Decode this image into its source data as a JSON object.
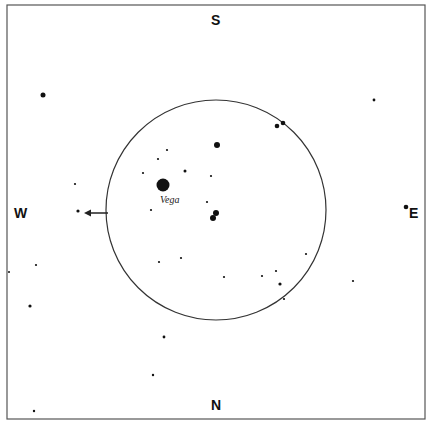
{
  "chart_data": {
    "type": "scatter",
    "directions": {
      "top": "S",
      "bottom": "N",
      "left": "W",
      "right": "E"
    },
    "circle": {
      "cx": 216,
      "cy": 210,
      "r": 110
    },
    "arrow": {
      "from": [
        108,
        213
      ],
      "to": [
        84,
        213
      ],
      "direction": "W"
    },
    "labels": [
      {
        "text": "Vega",
        "x": 172,
        "y": 203
      }
    ],
    "stars": [
      {
        "x": 43,
        "y": 95,
        "r": 2.5
      },
      {
        "x": 374,
        "y": 100,
        "r": 1.4
      },
      {
        "x": 277,
        "y": 126,
        "r": 2.3
      },
      {
        "x": 283,
        "y": 123,
        "r": 2.3
      },
      {
        "x": 217,
        "y": 145,
        "r": 3
      },
      {
        "x": 167,
        "y": 150,
        "r": 1.1
      },
      {
        "x": 158,
        "y": 159,
        "r": 1.1
      },
      {
        "x": 185,
        "y": 171,
        "r": 1.5
      },
      {
        "x": 143,
        "y": 173,
        "r": 1.1
      },
      {
        "x": 211,
        "y": 176,
        "r": 1.1
      },
      {
        "x": 75,
        "y": 184,
        "r": 1.1
      },
      {
        "x": 163,
        "y": 185,
        "r": 6.5,
        "name": "Vega"
      },
      {
        "x": 207,
        "y": 202,
        "r": 1.1
      },
      {
        "x": 406,
        "y": 207,
        "r": 2.3
      },
      {
        "x": 78,
        "y": 211,
        "r": 1.6
      },
      {
        "x": 151,
        "y": 210,
        "r": 1.1
      },
      {
        "x": 216,
        "y": 213,
        "r": 3
      },
      {
        "x": 213,
        "y": 218,
        "r": 3
      },
      {
        "x": 9,
        "y": 272,
        "r": 1
      },
      {
        "x": 36,
        "y": 265,
        "r": 1.1
      },
      {
        "x": 159,
        "y": 262,
        "r": 1.1
      },
      {
        "x": 181,
        "y": 258,
        "r": 1.1
      },
      {
        "x": 306,
        "y": 254,
        "r": 1.1
      },
      {
        "x": 224,
        "y": 277,
        "r": 1.1
      },
      {
        "x": 262,
        "y": 276,
        "r": 1.1
      },
      {
        "x": 276,
        "y": 271,
        "r": 1.1
      },
      {
        "x": 280,
        "y": 284,
        "r": 1.6
      },
      {
        "x": 284,
        "y": 299,
        "r": 1.1
      },
      {
        "x": 353,
        "y": 281,
        "r": 1.1
      },
      {
        "x": 30,
        "y": 306,
        "r": 1.6
      },
      {
        "x": 164,
        "y": 337,
        "r": 1.4
      },
      {
        "x": 153,
        "y": 375,
        "r": 1.2
      },
      {
        "x": 34,
        "y": 411,
        "r": 1.2
      }
    ]
  },
  "labels": {
    "south": "S",
    "north": "N",
    "west": "W",
    "east": "E",
    "vega": "Vega"
  }
}
